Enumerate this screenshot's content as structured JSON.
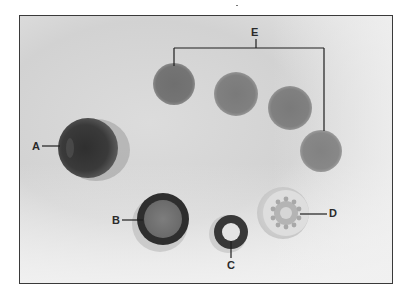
{
  "figure": {
    "labels": {
      "A": "A",
      "B": "B",
      "C": "C",
      "D": "D",
      "E": "E"
    },
    "colors": {
      "frame_border": "#3a3a3a",
      "background": "#d8d8d8",
      "leader_line": "#1e1e1e",
      "disc_e": "#7a7a7a",
      "cylinder_a": "#3c3c3c",
      "ring_b": "#2e2e2e",
      "ring_c": "#383838",
      "gear_d": "#cfcfcf"
    },
    "parts": [
      {
        "id": "A",
        "kind": "cylindrical cup"
      },
      {
        "id": "B",
        "kind": "large ring with filter"
      },
      {
        "id": "C",
        "kind": "small O-ring"
      },
      {
        "id": "D",
        "kind": "translucent toothed disc"
      },
      {
        "id": "E",
        "kind": "set of four discs",
        "count": 4
      }
    ]
  }
}
